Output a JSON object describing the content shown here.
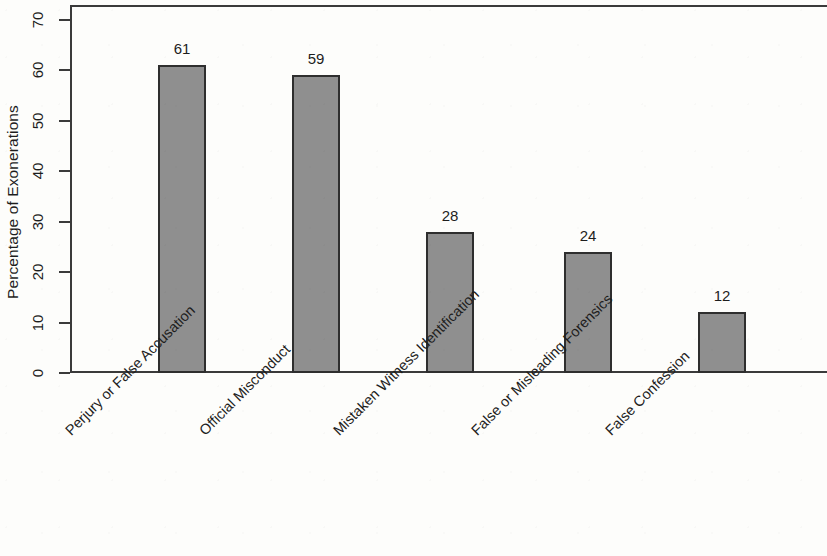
{
  "chart_data": {
    "type": "bar",
    "title": "",
    "subtitle": "",
    "xlabel": "",
    "ylabel": "Percentage of Exonerations",
    "categories": [
      "Perjury or False Accusation",
      "Official Misconduct",
      "Mistaken Witness Identification",
      "False or Misleading Forensics",
      "False Confession"
    ],
    "values": [
      61,
      59,
      28,
      24,
      12
    ],
    "value_labels": [
      "61",
      "59",
      "28",
      "24",
      "12"
    ],
    "ylim": [
      0,
      70
    ],
    "ytick_labels": [
      "0",
      "10",
      "20",
      "30",
      "40",
      "50",
      "60",
      "70"
    ],
    "ytick_values": [
      0,
      10,
      20,
      30,
      40,
      50,
      60,
      70
    ],
    "grid": false,
    "legend": false,
    "legend_position": "none",
    "bar_fill_color": "#8f8f8f",
    "bar_edge_color": "#2e2e2e",
    "axis_color": "#3a3a3a",
    "background_color": "#fdfdfb",
    "text_color": "#1d1d1d"
  }
}
